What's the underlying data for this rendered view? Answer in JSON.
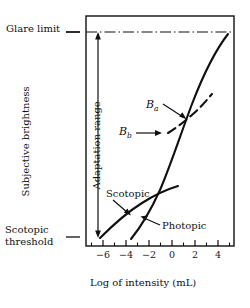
{
  "figure": {
    "title": "",
    "kind": "line-plot"
  },
  "labels": {
    "glare_limit": "Glare limit",
    "scotopic_threshold_line1": "Scotopic",
    "scotopic_threshold_line2": "threshold",
    "y_axis": "Subjective brightness",
    "adaptation_range": "Adaptation range",
    "x_axis": "Log of intensity (mL)",
    "scotopic_curve": "Scotopic",
    "photopic_curve": "Photopic",
    "b_a": "B",
    "b_a_sub": "a",
    "b_b": "B",
    "b_b_sub": "b"
  },
  "colors": {
    "ink": "#101010",
    "background": "#ffffff"
  },
  "chart_data": {
    "type": "line",
    "title": "",
    "xlabel": "Log of intensity (mL)",
    "ylabel": "Subjective brightness",
    "xlim": [
      -7,
      5.6
    ],
    "ylim": [
      0,
      1
    ],
    "grid": false,
    "legend": "none",
    "xticks_major": [
      -6,
      -4,
      -2,
      0,
      2,
      4
    ],
    "xtick_labels": [
      "-6",
      "-4",
      "-2",
      "0",
      "2",
      "4"
    ],
    "xticks_minor": [
      -5,
      -3,
      -1,
      1,
      3,
      5
    ],
    "yticks_named": [
      {
        "label": "Glare limit",
        "value": 0.93
      },
      {
        "label": "Scotopic threshold",
        "value": 0.04
      }
    ],
    "annotations": [
      {
        "text": "Glare limit",
        "target_value": 0.93,
        "style": "dash-dot-horizontal-line"
      },
      {
        "text": "Adaptation range",
        "style": "double-headed-vertical-arrow",
        "from_value": 0.04,
        "to_value": 0.93,
        "at_x": -5.9
      },
      {
        "text": "Scotopic",
        "points_to": "scotopic-curve"
      },
      {
        "text": "Photopic",
        "points_to": "photopic-curve"
      },
      {
        "text": "Ba",
        "points_to": "adaptation-curve-upper-intersection"
      },
      {
        "text": "Bb",
        "points_to": "adaptation-curve-lower-end"
      }
    ],
    "series": [
      {
        "name": "Photopic",
        "style": "solid",
        "x": [
          -3.0,
          -2.4,
          -1.8,
          -1.2,
          -0.6,
          0.0,
          0.6,
          1.2,
          1.8,
          2.4,
          3.0,
          3.6,
          4.2,
          4.8,
          5.3
        ],
        "y": [
          0.035,
          0.075,
          0.12,
          0.175,
          0.235,
          0.3,
          0.375,
          0.46,
          0.545,
          0.635,
          0.715,
          0.785,
          0.845,
          0.895,
          0.93
        ]
      },
      {
        "name": "Scotopic",
        "style": "solid",
        "x": [
          -5.9,
          -5.2,
          -4.4,
          -3.6,
          -2.8,
          -2.0,
          -1.2,
          -0.4,
          0.2
        ],
        "y": [
          0.035,
          0.085,
          0.135,
          0.185,
          0.225,
          0.265,
          0.3,
          0.335,
          0.36
        ]
      },
      {
        "name": "Adaptation curve",
        "style": "dashed",
        "x": [
          -0.35,
          0.2,
          0.8,
          1.4,
          2.0,
          2.6
        ],
        "y": [
          0.455,
          0.49,
          0.525,
          0.565,
          0.6,
          0.645
        ]
      }
    ]
  }
}
